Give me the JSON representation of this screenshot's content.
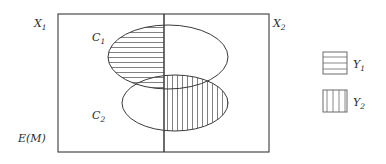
{
  "figure": {
    "kind": "venn-diagram",
    "universe_label": "E(M)",
    "left_half_label": "X",
    "left_half_sub": "1",
    "right_half_label": "X",
    "right_half_sub": "2",
    "sets": [
      {
        "id": "C1",
        "label": "C",
        "sub": "1",
        "shape": "ellipse",
        "cx": 168,
        "cy": 57,
        "rx": 60,
        "ry": 32,
        "label_x": 92,
        "label_y": 41,
        "hatch": "horizontal",
        "hatched_side": "left"
      },
      {
        "id": "C2",
        "label": "C",
        "sub": "2",
        "shape": "ellipse",
        "cx": 175,
        "cy": 103,
        "rx": 53,
        "ry": 28,
        "label_x": 92,
        "label_y": 119,
        "hatch": "vertical",
        "hatched_side": "right"
      }
    ],
    "frame": {
      "x": 58,
      "y": 14,
      "width": 211,
      "height": 138
    },
    "divider_x": 164,
    "labels": {
      "x1": {
        "text": "X",
        "sub": "1",
        "x": 34,
        "y": 27
      },
      "x2": {
        "text": "X",
        "sub": "2",
        "x": 273,
        "y": 27
      },
      "em": {
        "text": "E(M)",
        "x": 18,
        "y": 142
      }
    },
    "colors": {
      "stroke": "#3a3a3a",
      "hatch": "#4a4a4a",
      "background": "#ffffff",
      "text": "#2b2b2b"
    },
    "hatch_spacing": 5
  },
  "legend": {
    "position": "right",
    "entries": [
      {
        "id": "Y1",
        "label": "Y",
        "sub": "1",
        "pattern": "horizontal",
        "swatch_x": 323,
        "swatch_y": 52,
        "swatch_w": 24,
        "swatch_h": 22,
        "label_x": 353,
        "label_y": 68
      },
      {
        "id": "Y2",
        "label": "Y",
        "sub": "2",
        "pattern": "vertical",
        "swatch_x": 323,
        "swatch_y": 90,
        "swatch_w": 24,
        "swatch_h": 22,
        "label_x": 353,
        "label_y": 106
      }
    ]
  }
}
